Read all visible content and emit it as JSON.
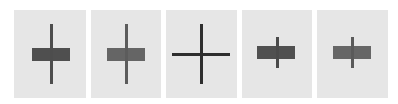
{
  "panels": [
    {
      "name": "tall-dark",
      "left": 14,
      "width": 72,
      "vline": {
        "x": 36,
        "top": 14,
        "height": 60,
        "color": "#4d4d4d"
      },
      "box": {
        "x": 18,
        "top": 38,
        "width": 38,
        "height": 13,
        "color": "#4f4f4f"
      }
    },
    {
      "name": "tall-light",
      "left": 91,
      "width": 70,
      "vline": {
        "x": 34,
        "top": 14,
        "height": 60,
        "color": "#5c5c5c"
      },
      "box": {
        "x": 16,
        "top": 38,
        "width": 38,
        "height": 13,
        "color": "#656565"
      }
    },
    {
      "name": "cross",
      "left": 166,
      "width": 71,
      "vline": {
        "x": 34,
        "top": 14,
        "height": 60,
        "color": "#2e2e2e"
      },
      "hline": {
        "x": 6,
        "top": 43,
        "width": 58,
        "color": "#2e2e2e"
      }
    },
    {
      "name": "short-dark",
      "left": 242,
      "width": 70,
      "vline": {
        "x": 34,
        "top": 27,
        "height": 31,
        "color": "#4a4a4a"
      },
      "box": {
        "x": 15,
        "top": 36,
        "width": 38,
        "height": 13,
        "color": "#505050"
      }
    },
    {
      "name": "short-light",
      "left": 317,
      "width": 71,
      "vline": {
        "x": 34,
        "top": 27,
        "height": 31,
        "color": "#5a5a5a"
      },
      "box": {
        "x": 16,
        "top": 36,
        "width": 38,
        "height": 13,
        "color": "#666666"
      }
    }
  ],
  "colors": {
    "background": "#ffffff",
    "panel": "#e6e6e6"
  }
}
